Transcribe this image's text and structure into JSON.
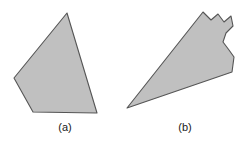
{
  "figure": {
    "background_color": "#ffffff",
    "shape_fill_color": "#c0c0c0",
    "shape_stroke_color": "#555555",
    "caption_color": "#1a1a1a"
  },
  "panels": [
    {
      "id": "a",
      "caption": "(a)",
      "shape_name": "convex-pentagon",
      "convex": true,
      "vertices": [
        [
          67,
          13
        ],
        [
          97,
          113
        ],
        [
          33,
          112
        ],
        [
          14,
          78
        ],
        [
          67,
          13
        ]
      ]
    },
    {
      "id": "b",
      "caption": "(b)",
      "shape_name": "non-convex-polygon",
      "convex": false,
      "vertices": [
        [
          203,
          12
        ],
        [
          211,
          20
        ],
        [
          218,
          14
        ],
        [
          224,
          22
        ],
        [
          231,
          16
        ],
        [
          233,
          26
        ],
        [
          226,
          33
        ],
        [
          223,
          42
        ],
        [
          229,
          50
        ],
        [
          234,
          57
        ],
        [
          232,
          72
        ],
        [
          127,
          108
        ],
        [
          203,
          12
        ]
      ]
    }
  ],
  "captions": {
    "a_label": "(a)",
    "b_label": "(b)"
  }
}
